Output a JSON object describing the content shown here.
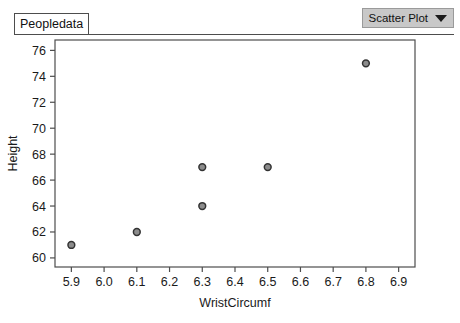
{
  "toolbar": {
    "dataset_tab_label": "Peopledata",
    "plot_type_label": "Scatter Plot",
    "caret_icon": "chevron-down-icon"
  },
  "chart_data": {
    "type": "scatter",
    "title": "",
    "xlabel": "WristCircumf",
    "ylabel": "Height",
    "xlim": [
      5.85,
      6.95
    ],
    "ylim": [
      59.3,
      76.8
    ],
    "grid": false,
    "legend": false,
    "x_ticks": [
      "5.9",
      "6.0",
      "6.1",
      "6.2",
      "6.3",
      "6.4",
      "6.5",
      "6.6",
      "6.7",
      "6.8",
      "6.9"
    ],
    "x_tick_values": [
      5.9,
      6.0,
      6.1,
      6.2,
      6.3,
      6.4,
      6.5,
      6.6,
      6.7,
      6.8,
      6.9
    ],
    "y_ticks": [
      "60",
      "62",
      "64",
      "66",
      "68",
      "70",
      "72",
      "74",
      "76"
    ],
    "y_tick_values": [
      60,
      62,
      64,
      66,
      68,
      70,
      72,
      74,
      76
    ],
    "points": [
      {
        "x": 5.9,
        "y": 61
      },
      {
        "x": 6.1,
        "y": 62
      },
      {
        "x": 6.3,
        "y": 64
      },
      {
        "x": 6.3,
        "y": 67
      },
      {
        "x": 6.5,
        "y": 67
      },
      {
        "x": 6.8,
        "y": 75
      }
    ],
    "marker": {
      "shape": "circle",
      "fill_color": "#8c8c8c",
      "edge_color": "#333333",
      "radius_px": 3.4
    }
  },
  "colors": {
    "frame": "#4d4d4d",
    "text": "#1a1a1a",
    "dropdown_bg": "#c8c8c8",
    "page_bg": "#ffffff"
  }
}
